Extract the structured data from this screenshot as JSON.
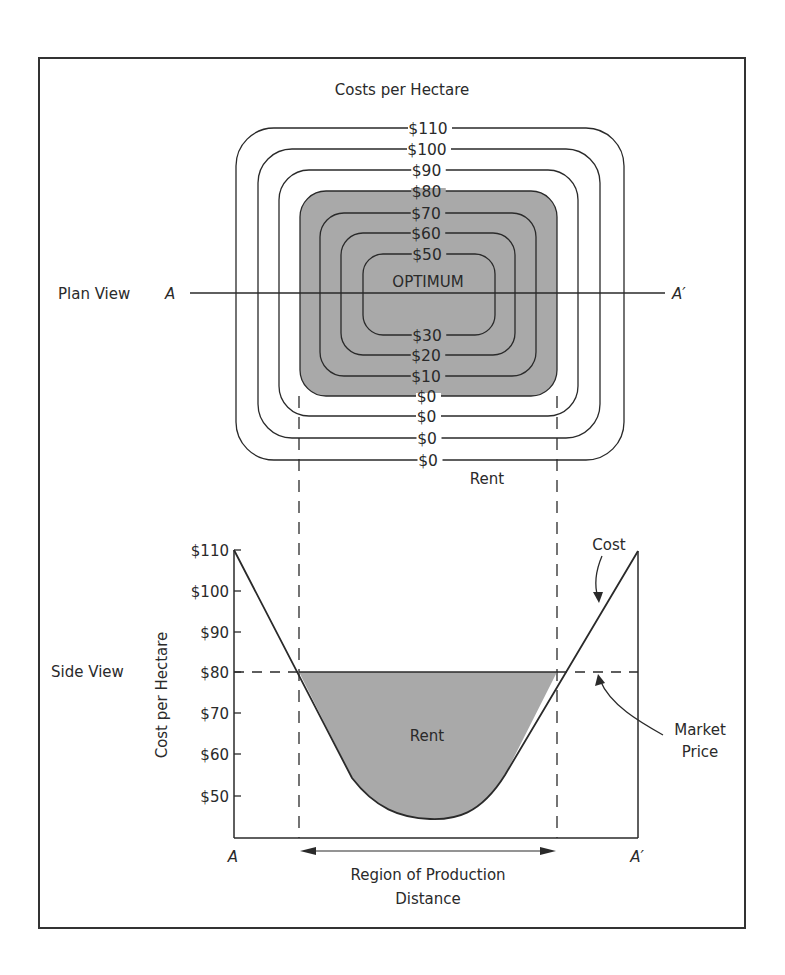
{
  "colors": {
    "ink": "#2a2a2a",
    "shade": "#a9a9a9",
    "frame": "#333333",
    "background": "#ffffff"
  },
  "plan_view": {
    "title": "Costs per Hectare",
    "label": "Plan View",
    "section_start": "A",
    "section_end": "A′",
    "center_label": "OPTIMUM",
    "rent_label": "Rent",
    "contours": [
      {
        "top_label": "$110",
        "bottom_label": "$0",
        "x1": 236,
        "y1": 128,
        "x2": 624,
        "y2": 460,
        "r": 38
      },
      {
        "top_label": "$100",
        "bottom_label": "$0",
        "x1": 258,
        "y1": 149,
        "x2": 600,
        "y2": 438,
        "r": 34
      },
      {
        "top_label": "$90",
        "bottom_label": "$0",
        "x1": 279,
        "y1": 170,
        "x2": 578,
        "y2": 416,
        "r": 30
      },
      {
        "top_label": "$80",
        "bottom_label": "$0",
        "x1": 300,
        "y1": 191,
        "x2": 557,
        "y2": 396,
        "r": 26,
        "shaded": true
      },
      {
        "top_label": "$70",
        "bottom_label": "$10",
        "x1": 320,
        "y1": 213,
        "x2": 536,
        "y2": 376,
        "r": 24
      },
      {
        "top_label": "$60",
        "bottom_label": "$20",
        "x1": 341,
        "y1": 233,
        "x2": 515,
        "y2": 355,
        "r": 22
      },
      {
        "top_label": "$50",
        "bottom_label": "$30",
        "x1": 363,
        "y1": 254,
        "x2": 495,
        "y2": 335,
        "r": 20
      }
    ]
  },
  "side_view": {
    "label": "Side View",
    "y_axis_label": "Cost per Hectare",
    "x_axis_label": "Distance",
    "region_label": "Region of Production",
    "rent_label": "Rent",
    "cost_label": "Cost",
    "market_price_label_1": "Market",
    "market_price_label_2": "Price",
    "x_start": "A",
    "x_end": "A′",
    "y_ticks": [
      "$110",
      "$100",
      "$90",
      "$80",
      "$70",
      "$60",
      "$50"
    ]
  },
  "chart_data": {
    "type": "line",
    "title": "Costs per Hectare",
    "xlabel": "Distance",
    "ylabel": "Cost per Hectare",
    "x": [
      "A",
      "A′"
    ],
    "y_ticks": [
      110,
      100,
      90,
      80,
      70,
      60,
      50
    ],
    "ylim": [
      40,
      110
    ],
    "series": [
      {
        "name": "Cost",
        "description": "V-shaped cost curve: $110 at A, minimum ~$45 at optimum centre, $110 at A′"
      },
      {
        "name": "Market Price",
        "values": [
          80,
          80
        ],
        "style": "dashed"
      }
    ],
    "annotations": [
      "Rent (shaded area between market price and cost)",
      "Region of Production (where cost < $80)"
    ],
    "plan_view_contours": {
      "top_labels": [
        "$110",
        "$100",
        "$90",
        "$80",
        "$70",
        "$60",
        "$50"
      ],
      "bottom_labels": [
        "$30",
        "$20",
        "$10",
        "$0",
        "$0",
        "$0",
        "$0"
      ],
      "center": "OPTIMUM",
      "shaded_region": "Rent ($80 contour and inside)"
    }
  }
}
